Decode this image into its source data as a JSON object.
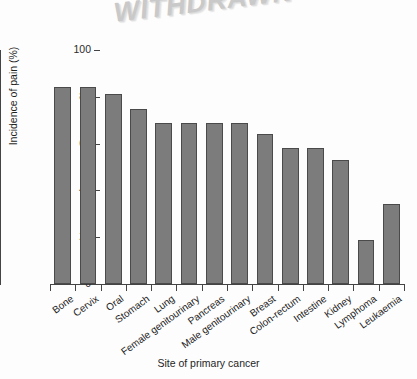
{
  "watermark": {
    "text": "WITHDRAWN"
  },
  "chart_data": {
    "type": "bar",
    "title": "",
    "subtitle": "",
    "xlabel": "Site of primary cancer",
    "ylabel": "Incidence of pain (%)",
    "categories": [
      "Bone",
      "Cervix",
      "Oral",
      "Stomach",
      "Lung",
      "Female genitourinary",
      "Pancreas",
      "Male genitourinary",
      "Breast",
      "Colon-rectum",
      "Intestine",
      "Kidney",
      "Lymphoma",
      "Leukaemia"
    ],
    "values": [
      84,
      84,
      81,
      75,
      69,
      69,
      69,
      69,
      64,
      58,
      58,
      53,
      19,
      34
    ],
    "ylim": [
      0,
      100
    ],
    "yticks": [
      0,
      20,
      40,
      60,
      80,
      100
    ],
    "ytick_labels": [
      "0",
      "20",
      "40",
      "60",
      "80",
      "100"
    ],
    "grid": false,
    "legend": null,
    "bar_color": "#7c7c7c",
    "bar_edge_color": "#4a4a4a",
    "axis_color": "#444444",
    "background_color": "#fdfdfd"
  }
}
